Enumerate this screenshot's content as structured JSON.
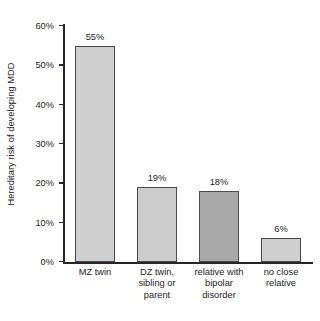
{
  "chart_data": {
    "type": "bar",
    "title": "",
    "subtitle": "",
    "xlabel": "",
    "ylabel": "Hereditary risk of developing MDD",
    "ylim": [
      0,
      60
    ],
    "ytick_labels": [
      "0%",
      "10%",
      "20%",
      "30%",
      "40%",
      "50%",
      "60%"
    ],
    "ytick_values": [
      0,
      10,
      20,
      30,
      40,
      50,
      60
    ],
    "grid": false,
    "legend": false,
    "categories": [
      "MZ twin",
      "DZ twin, sibling or parent",
      "relative with bipolar disorder",
      "no close relative"
    ],
    "values": [
      55,
      19,
      18,
      6
    ],
    "data_labels": [
      "55%",
      "19%",
      "18%",
      "6%"
    ],
    "bars": [
      {
        "category_lines": [
          "MZ twin"
        ],
        "value": 55,
        "label": "55%",
        "fill": "#cfcfcf",
        "stroke": "#4a4a4a"
      },
      {
        "category_lines": [
          "DZ twin,",
          "sibling or",
          "parent"
        ],
        "value": 19,
        "label": "19%",
        "fill": "#cccccc",
        "stroke": "#4a4a4a"
      },
      {
        "category_lines": [
          "relative with",
          "bipolar",
          "disorder"
        ],
        "value": 18,
        "label": "18%",
        "fill": "#a9a9a9",
        "stroke": "#4a4a4a"
      },
      {
        "category_lines": [
          "no close",
          "relative"
        ],
        "value": 6,
        "label": "6%",
        "fill": "#cfcfcf",
        "stroke": "#4a4a4a"
      }
    ],
    "colors": {
      "background": "#ffffff",
      "axis": "#262626",
      "text": "#1c1c1c",
      "bar_light": "#cfcfcf",
      "bar_dark": "#a9a9a9",
      "bar_outline": "#4a4a4a"
    }
  }
}
